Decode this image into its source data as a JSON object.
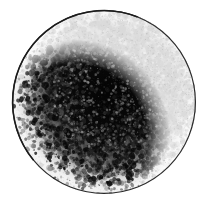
{
  "image": {
    "type": "grayscale-micrograph",
    "subject_name": "spherical-specimen",
    "alt_text": "Grayscale micrograph of a single spherical specimen with a pale translucent rim and a dense granular dark core",
    "width": 204,
    "height": 208,
    "background_color": "#ffffff",
    "caption": "",
    "label": "",
    "scale_bar": ""
  },
  "specimen": {
    "shape": "circle",
    "center_x": 104,
    "center_y": 102,
    "radius": 92,
    "outline_color": "#2a2a2a",
    "outline_width": 1.2,
    "rim_color": "#f2f2f2",
    "rim_highlight_color": "#fafafa",
    "core_color": "#050505",
    "core_center_x": 110,
    "core_center_y": 95,
    "core_radius": 58,
    "texture": "granular-stipple",
    "texture_density": 0.55,
    "speckle_light_color": "#d8d8d8",
    "speckle_dark_color": "#101010",
    "gradient_stops": [
      {
        "offset": 0.0,
        "gray": 4
      },
      {
        "offset": 0.45,
        "gray": 10
      },
      {
        "offset": 0.62,
        "gray": 45
      },
      {
        "offset": 0.76,
        "gray": 130
      },
      {
        "offset": 0.88,
        "gray": 215
      },
      {
        "offset": 1.0,
        "gray": 243
      }
    ]
  },
  "render": {
    "seed": 20240617,
    "stipple_count": 9000,
    "fleck_count": 2400,
    "highlight_count": 700,
    "blur_px": 0.35
  }
}
